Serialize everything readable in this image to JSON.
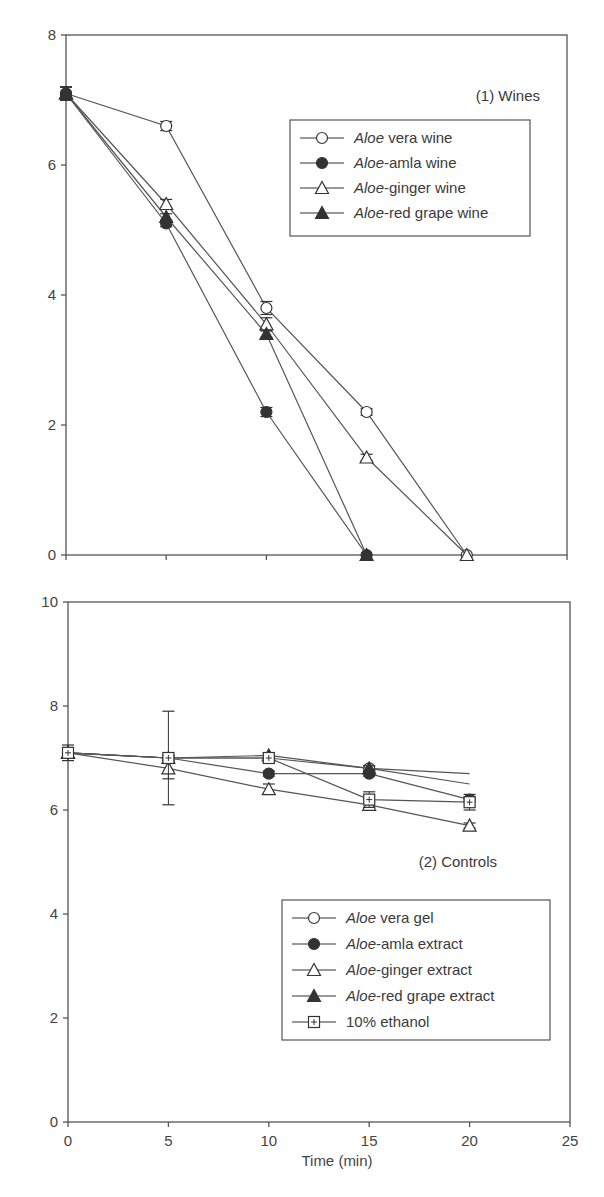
{
  "chart_data": [
    {
      "type": "line",
      "panel": "top",
      "title": "(1) Wines",
      "xlabel": "",
      "ylabel": "",
      "xlim": [
        0,
        25
      ],
      "ylim": [
        0,
        8
      ],
      "xticks": [
        0,
        5,
        10,
        15,
        20,
        25
      ],
      "yticks": [
        0,
        2,
        4,
        6,
        8
      ],
      "ytick_labels": [
        "0",
        "2",
        "4",
        "6",
        "8"
      ],
      "show_xtick_labels": false,
      "grid": false,
      "legend_position": "upper right",
      "series": [
        {
          "name_italic": "Aloe",
          "name_rest": " vera wine",
          "marker": "open-circle",
          "x": [
            0,
            5,
            10,
            15,
            20
          ],
          "y": [
            7.1,
            6.6,
            3.8,
            2.2,
            0.0
          ],
          "err": [
            0.1,
            0.07,
            0.1,
            0.05,
            0
          ]
        },
        {
          "name_italic": "Aloe",
          "name_rest": "-amla wine",
          "marker": "filled-circle",
          "x": [
            0,
            5,
            10,
            15
          ],
          "y": [
            7.1,
            5.1,
            2.2,
            0.0
          ],
          "err": [
            0.1,
            0.05,
            0.07,
            0
          ]
        },
        {
          "name_italic": "Aloe",
          "name_rest": "-ginger wine",
          "marker": "open-triangle",
          "x": [
            0,
            5,
            10,
            15,
            20
          ],
          "y": [
            7.1,
            5.4,
            3.55,
            1.5,
            0.0
          ],
          "err": [
            0.1,
            0.07,
            0.1,
            0.05,
            0
          ]
        },
        {
          "name_italic": "Aloe",
          "name_rest": "-red grape wine",
          "marker": "filled-triangle",
          "x": [
            0,
            5,
            10,
            15
          ],
          "y": [
            7.1,
            5.2,
            3.4,
            0.0
          ],
          "err": [
            0.1,
            0.05,
            0.05,
            0
          ]
        }
      ]
    },
    {
      "type": "line",
      "panel": "bottom",
      "title": "(2) Controls",
      "xlabel": "Time (min)",
      "ylabel": "",
      "xlim": [
        0,
        25
      ],
      "ylim": [
        0,
        10
      ],
      "xticks": [
        0,
        5,
        10,
        15,
        20,
        25
      ],
      "xtick_labels": [
        "0",
        "5",
        "10",
        "15",
        "20",
        "25"
      ],
      "yticks": [
        0,
        2,
        4,
        6,
        8,
        10
      ],
      "ytick_labels": [
        "0",
        "2",
        "4",
        "6",
        "8",
        "10"
      ],
      "show_xtick_labels": true,
      "grid": false,
      "legend_position": "lower right",
      "series": [
        {
          "name_italic": "Aloe",
          "name_rest": " vera gel",
          "marker": "open-circle",
          "x": [
            0,
            5,
            10,
            15,
            20
          ],
          "y": [
            7.1,
            7.0,
            7.0,
            6.8,
            6.7
          ],
          "err": [
            0.1,
            0.05,
            0.05,
            0.05,
            0
          ],
          "end_marker": false
        },
        {
          "name_italic": "Aloe",
          "name_rest": "-amla extract",
          "marker": "filled-circle",
          "x": [
            0,
            5,
            10,
            15,
            20
          ],
          "y": [
            7.1,
            7.0,
            6.7,
            6.7,
            6.2
          ],
          "err": [
            0.1,
            0.05,
            0.05,
            0.05,
            0.05
          ]
        },
        {
          "name_italic": "Aloe",
          "name_rest": "-ginger extract",
          "marker": "open-triangle",
          "x": [
            0,
            5,
            10,
            15,
            20
          ],
          "y": [
            7.1,
            6.8,
            6.4,
            6.1,
            5.7
          ],
          "err": [
            0.1,
            0.2,
            0.1,
            0.05,
            0.05
          ]
        },
        {
          "name_italic": "Aloe",
          "name_rest": "-red grape extract",
          "marker": "filled-triangle",
          "x": [
            0,
            5,
            10,
            15,
            20
          ],
          "y": [
            7.1,
            7.0,
            7.05,
            6.8,
            6.5
          ],
          "err": [
            0.1,
            0.05,
            0.05,
            0.05,
            0
          ],
          "end_marker": false
        },
        {
          "name_italic": "",
          "name_rest": "10% ethanol",
          "marker": "square-plus",
          "x": [
            0,
            5,
            10,
            15,
            20
          ],
          "y": [
            7.1,
            7.0,
            7.0,
            6.2,
            6.15
          ],
          "err": [
            0.15,
            0.9,
            0.1,
            0.15,
            0.15
          ]
        }
      ]
    }
  ],
  "panels": {
    "top": {
      "label": "(1) Wines"
    },
    "bottom": {
      "label": "(2) Controls",
      "xlabel": "Time (min)"
    }
  }
}
